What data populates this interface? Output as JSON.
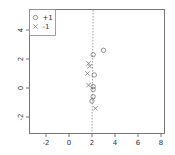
{
  "chart_data": {
    "type": "scatter",
    "title": "",
    "xlabel": "",
    "ylabel": "",
    "xlim": [
      -3.5,
      8.4
    ],
    "ylim": [
      -3.2,
      5.5
    ],
    "x_ticks": [
      -2,
      0,
      2,
      4,
      6,
      8
    ],
    "y_ticks": [
      -2,
      0,
      2,
      4
    ],
    "grid": false,
    "legend_position": "top-left",
    "legend": [
      {
        "label": "+1",
        "marker": "circle"
      },
      {
        "label": "-1",
        "marker": "x"
      }
    ],
    "series": [
      {
        "name": "+1",
        "marker": "circle",
        "points": [
          [
            3.0,
            2.6
          ],
          [
            2.1,
            2.3
          ],
          [
            2.2,
            0.9
          ],
          [
            2.1,
            0.1
          ],
          [
            2.1,
            -0.1
          ],
          [
            2.1,
            -0.6
          ],
          [
            2.0,
            -0.9
          ]
        ]
      },
      {
        "name": "-1",
        "marker": "x",
        "points": [
          [
            1.7,
            1.7
          ],
          [
            1.8,
            1.5
          ],
          [
            1.6,
            1.0
          ],
          [
            1.7,
            0.2
          ],
          [
            2.3,
            -1.4
          ]
        ]
      }
    ],
    "annotations": [
      {
        "type": "dashed-line",
        "description": "decision boundary",
        "from": [
          2.1,
          5.5
        ],
        "to": [
          2.0,
          -3.2
        ]
      }
    ]
  },
  "colors": {
    "axis": "#555555",
    "marker": "#666666",
    "boundary": "#888888",
    "legend_border": "#888888"
  }
}
